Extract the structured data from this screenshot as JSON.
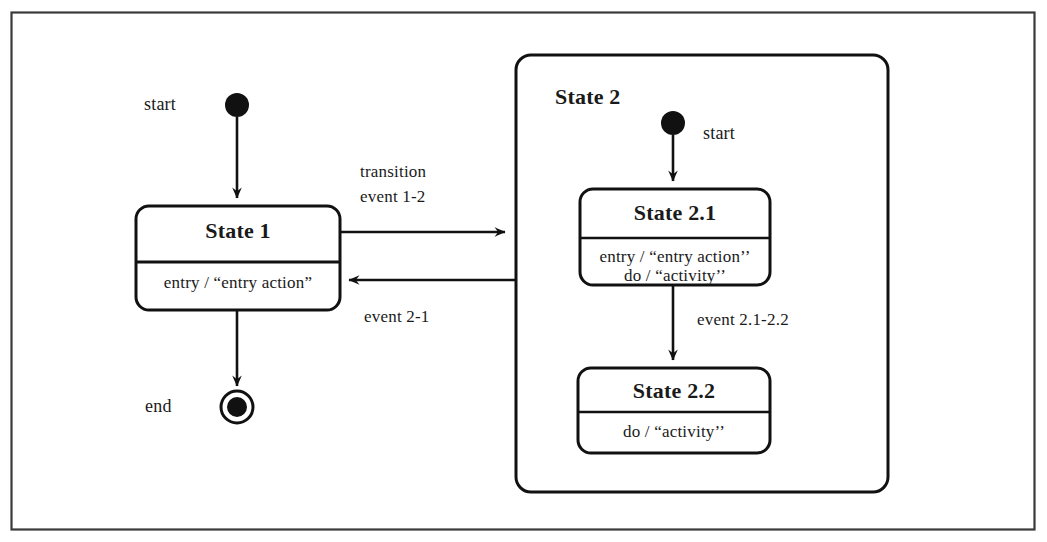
{
  "diagram": {
    "type": "uml-state-machine",
    "title": "",
    "frame": {
      "stroke": "#3a3a3a"
    },
    "stroke_color": "#111111",
    "background": "#ffffff",
    "start_label": "start",
    "end_label": "end",
    "states": {
      "state1": {
        "name": "State 1",
        "actions": [
          "entry / “entry action”"
        ]
      },
      "state2": {
        "name": "State 2",
        "start_label": "start"
      },
      "state21": {
        "name": "State 2.1",
        "actions": [
          "entry / “entry action’’",
          "do / “activity’’"
        ]
      },
      "state22": {
        "name": "State 2.2",
        "actions": [
          "do / “activity’’"
        ]
      }
    },
    "transitions": {
      "t1_to_2_line1": "transition",
      "t1_to_2_line2": "event 1-2",
      "t2_to_1": "event 2-1",
      "t21_to_22": "event 2.1-2.2"
    }
  }
}
